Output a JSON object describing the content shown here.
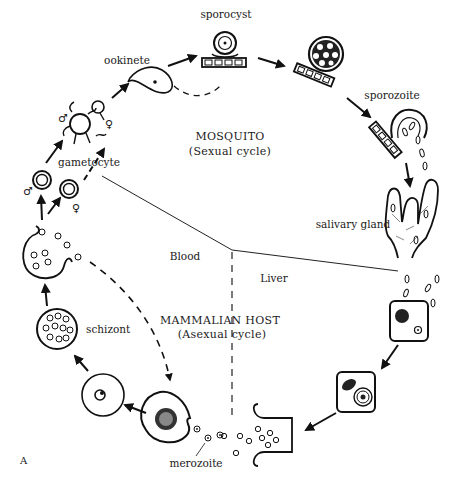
{
  "diagram": {
    "panel_letter": "A",
    "regions": {
      "mosquito": {
        "name": "MOSQUITO",
        "subtitle": "(Sexual cycle)"
      },
      "host": {
        "name": "MAMMALIAN HOST",
        "subtitle": "(Asexual cycle)"
      },
      "blood": "Blood",
      "liver": "Liver"
    },
    "stages": {
      "ookinete": "ookinete",
      "sporocyst": "sporocyst",
      "sporozoite": "sporozoite",
      "salivary_gland": "salivary gland",
      "gametocyte": "gametocyte",
      "schizont": "schizont",
      "merozoite": "merozoite"
    },
    "symbols": {
      "male": "♂",
      "female": "♀"
    },
    "colors": {
      "ink": "#111111",
      "background": "#ffffff"
    }
  }
}
